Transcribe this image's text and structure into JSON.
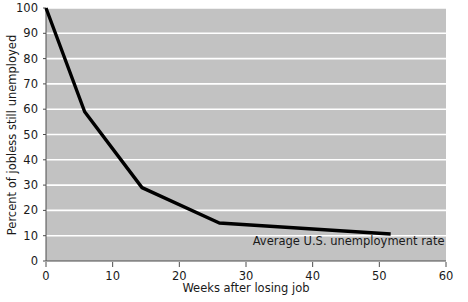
{
  "chart_data": {
    "type": "line",
    "title": "",
    "xlabel": "Weeks after losing job",
    "ylabel": "Percent of jobless still unemployed",
    "xlim": [
      0,
      60
    ],
    "ylim": [
      0,
      100
    ],
    "xticks": [
      0,
      10,
      20,
      30,
      40,
      50,
      60
    ],
    "yticks": [
      0,
      10,
      20,
      30,
      40,
      50,
      60,
      70,
      80,
      90,
      100
    ],
    "xtick_labels": [
      "0",
      "10",
      "20",
      "30",
      "40",
      "50",
      "60"
    ],
    "ytick_labels": [
      "0",
      "10",
      "20",
      "30",
      "40",
      "50",
      "60",
      "70",
      "80",
      "90",
      "100"
    ],
    "grid": "horizontal-white",
    "plot_background": "#c2c2c2",
    "line_color": "#000000",
    "line_width": 3.4,
    "legend": "none",
    "series": [
      {
        "name": "Percent of jobless still unemployed",
        "x": [
          0,
          5.8,
          14.4,
          26.0,
          51.7
        ],
        "values": [
          100,
          59,
          29,
          15,
          10.7
        ]
      }
    ],
    "annotations": [
      {
        "text": "Average U.S. unemployment rate",
        "x": 31.0,
        "y": 6.5
      }
    ]
  },
  "axes": {
    "x_title": "Weeks after losing job",
    "y_title": "Percent of jobless still unemployed"
  },
  "annotation": {
    "average_rate_label": "Average U.S. unemployment rate"
  },
  "colors": {
    "plot_bg": "#c2c2c2",
    "gridline": "#ffffff",
    "line": "#000000",
    "text": "#1a1a1a",
    "axis": "#4d4d4d"
  }
}
